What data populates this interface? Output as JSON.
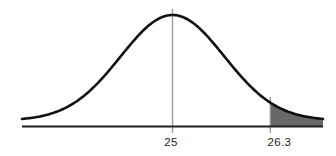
{
  "chart_data": {
    "type": "area",
    "subtype": "normal-distribution-right-tail",
    "title": "",
    "xlabel": "",
    "ylabel": "",
    "x_axis": {
      "min": 23,
      "max": 27,
      "grid": false,
      "tick_labels": [
        "25",
        "26.3"
      ]
    },
    "mean": {
      "value": 25,
      "label": "25"
    },
    "cutoff": {
      "value": 26.3,
      "label": "26.3"
    },
    "sigma": 0.69,
    "shade": {
      "from": 26.3,
      "to": 27,
      "region": "right-tail"
    },
    "colors": {
      "background": "#ffffff",
      "curve": "#101010",
      "axis": "#1f1f1f",
      "reference_line": "#9a9a9a",
      "shade_fill": "#686868",
      "label": "#1c1c1c"
    }
  }
}
